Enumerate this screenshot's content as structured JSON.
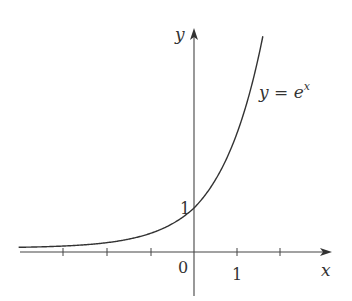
{
  "chart_data": {
    "type": "line",
    "title": "",
    "function": "y = e^x",
    "series": [
      {
        "name": "y = e^x",
        "x": [
          -4,
          -3.5,
          -3,
          -2.5,
          -2,
          -1.5,
          -1,
          -0.5,
          0,
          0.25,
          0.5,
          0.75,
          1,
          1.25,
          1.5,
          1.6
        ],
        "values": [
          0.018,
          0.03,
          0.05,
          0.082,
          0.135,
          0.223,
          0.368,
          0.607,
          1,
          1.284,
          1.649,
          2.117,
          2.718,
          3.49,
          4.482,
          4.953
        ]
      }
    ],
    "xlabel": "x",
    "ylabel": "y",
    "xlim": [
      -4.1,
      3.2
    ],
    "ylim": [
      -1.1,
      5.7
    ],
    "x_ticks": [
      -3,
      -2,
      -1,
      0,
      1,
      2
    ],
    "x_tick_labels": [
      "",
      "",
      "",
      "0",
      "1",
      ""
    ],
    "y_tick_labels": [
      "1"
    ],
    "grid": false,
    "legend": "none",
    "annotations": [
      {
        "text": "y = e^x",
        "position": "right of curve near top"
      }
    ]
  },
  "labels": {
    "y_axis": "y",
    "x_axis": "x",
    "origin": "0",
    "x_one": "1",
    "y_one": "1",
    "curve_lhs": "y = e",
    "curve_exp": "x"
  },
  "colors": {
    "curve": "#333333",
    "axes": "#444444",
    "background": "#ffffff"
  }
}
